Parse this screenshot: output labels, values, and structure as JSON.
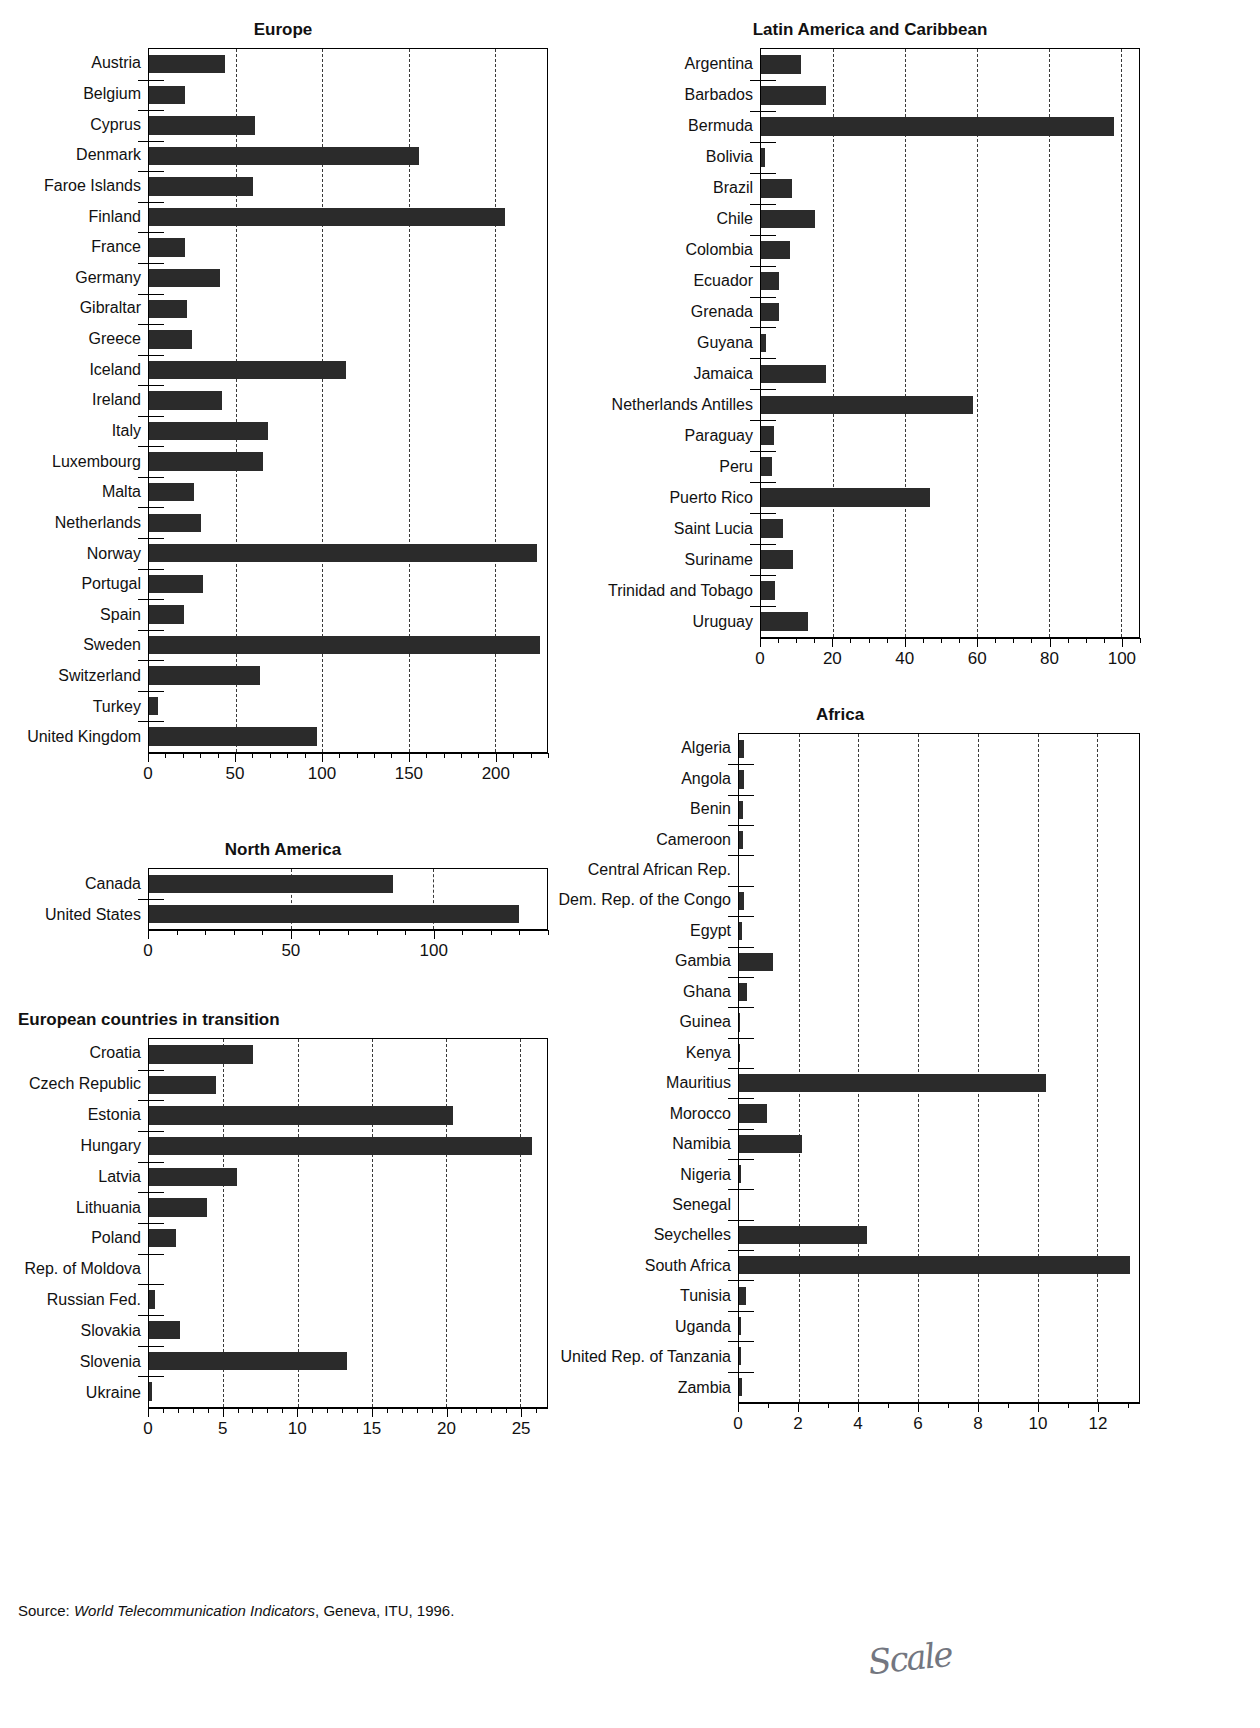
{
  "source": {
    "prefix": "Source: ",
    "italic": "World Telecommunication Indicators",
    "suffix": ", Geneva, ITU, 1996."
  },
  "annotation": {
    "handwriting": "Scale"
  },
  "chart_data": [
    {
      "id": "europe",
      "type": "bar",
      "orientation": "horizontal",
      "title": "Europe",
      "xlabel": "",
      "ylabel": "",
      "xlim": [
        0,
        230
      ],
      "xticks": [
        0,
        50,
        100,
        150,
        200
      ],
      "minor_tick_step": 10,
      "grid": "vertical-dashed",
      "legend": "none",
      "categories": [
        "Austria",
        "Belgium",
        "Cyprus",
        "Denmark",
        "Faroe Islands",
        "Finland",
        "France",
        "Germany",
        "Gibraltar",
        "Greece",
        "Iceland",
        "Ireland",
        "Italy",
        "Luxembourg",
        "Malta",
        "Netherlands",
        "Norway",
        "Portugal",
        "Spain",
        "Sweden",
        "Switzerland",
        "Turkey",
        "United Kingdom"
      ],
      "values": [
        44,
        21,
        61,
        156,
        60,
        206,
        21,
        41,
        22,
        25,
        114,
        42,
        69,
        66,
        26,
        30,
        224,
        31,
        20,
        226,
        64,
        5,
        97
      ]
    },
    {
      "id": "latin-america",
      "type": "bar",
      "orientation": "horizontal",
      "title": "Latin America and Caribbean",
      "xlabel": "",
      "ylabel": "",
      "xlim": [
        0,
        105
      ],
      "xticks": [
        0,
        20,
        40,
        60,
        80,
        100
      ],
      "minor_tick_step": 5,
      "grid": "vertical-dashed",
      "legend": "none",
      "categories": [
        "Argentina",
        "Barbados",
        "Bermuda",
        "Bolivia",
        "Brazil",
        "Chile",
        "Colombia",
        "Ecuador",
        "Grenada",
        "Guyana",
        "Jamaica",
        "Netherlands Antilles",
        "Paraguay",
        "Peru",
        "Puerto Rico",
        "Saint Lucia",
        "Suriname",
        "Trinidad and Tobago",
        "Uruguay"
      ],
      "values": [
        11,
        18,
        98,
        1,
        8.5,
        15,
        8,
        5,
        5,
        1.5,
        18,
        59,
        3.5,
        3,
        47,
        6,
        9,
        4,
        13
      ]
    },
    {
      "id": "north-america",
      "type": "bar",
      "orientation": "horizontal",
      "title": "North America",
      "xlabel": "",
      "ylabel": "",
      "xlim": [
        0,
        140
      ],
      "xticks": [
        0,
        50,
        100
      ],
      "minor_tick_step": 10,
      "grid": "vertical-dashed",
      "legend": "none",
      "categories": [
        "Canada",
        "United States"
      ],
      "values": [
        86,
        130
      ]
    },
    {
      "id": "africa",
      "type": "bar",
      "orientation": "horizontal",
      "title": "Africa",
      "xlabel": "",
      "ylabel": "",
      "xlim": [
        0,
        13.4
      ],
      "xticks": [
        0,
        2,
        4,
        6,
        8,
        10,
        12
      ],
      "minor_tick_step": 1,
      "grid": "vertical-dashed",
      "legend": "none",
      "categories": [
        "Algeria",
        "Angola",
        "Benin",
        "Cameroon",
        "Central African Rep.",
        "Dem. Rep. of the Congo",
        "Egypt",
        "Gambia",
        "Ghana",
        "Guinea",
        "Kenya",
        "Mauritius",
        "Morocco",
        "Namibia",
        "Nigeria",
        "Senegal",
        "Seychelles",
        "South Africa",
        "Tunisia",
        "Uganda",
        "United Rep. of Tanzania",
        "Zambia"
      ],
      "values": [
        0.16,
        0.16,
        0.12,
        0.14,
        0.0,
        0.17,
        0.09,
        1.15,
        0.28,
        0.05,
        0.05,
        10.3,
        0.95,
        2.1,
        0.08,
        0.0,
        4.3,
        13.1,
        0.25,
        0.08,
        0.07,
        0.1
      ]
    },
    {
      "id": "european-transition",
      "type": "bar",
      "orientation": "horizontal",
      "title": "European countries in transition",
      "xlabel": "",
      "ylabel": "",
      "xlim": [
        0,
        26.8
      ],
      "xticks": [
        0,
        5,
        10,
        15,
        20,
        25
      ],
      "minor_tick_step": 1,
      "grid": "vertical-dashed",
      "legend": "none",
      "categories": [
        "Croatia",
        "Czech Republic",
        "Estonia",
        "Hungary",
        "Latvia",
        "Lithuania",
        "Poland",
        "Rep. of Moldova",
        "Russian Fed.",
        "Slovakia",
        "Slovenia",
        "Ukraine"
      ],
      "values": [
        7.0,
        4.5,
        20.5,
        25.8,
        5.9,
        3.9,
        1.8,
        0.0,
        0.4,
        2.1,
        13.3,
        0.2
      ]
    }
  ]
}
